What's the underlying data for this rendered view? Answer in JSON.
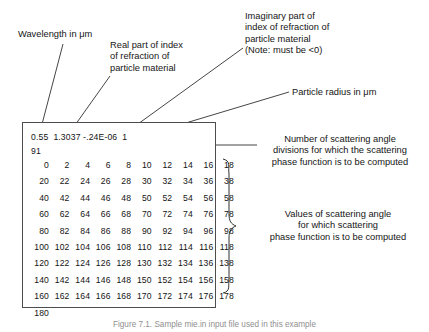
{
  "figure": {
    "caption": "Figure 7.1. Sample mie.in input file used in this example"
  },
  "annotations": {
    "wavelength": "Wavelength in μm",
    "real_index": "Real part of index\nof refraction of\nparticle material",
    "imaginary_index": "Imaginary part of\nindex of refraction of\nparticle material\n(Note: must be <0)",
    "particle_radius": "Particle radius in μm",
    "num_divisions": "Number of scattering angle\ndivisions for which the scattering\nphase function is to be computed",
    "angle_values": "Values of scattering angle\nfor which scattering\nphase function is to be computed"
  },
  "input_file": {
    "header_line": "0.55  1.3037 -.24E-06  1",
    "header_tokens": [
      "0.55",
      "1.3037",
      "-.24E-06",
      "1"
    ],
    "count_line": "91",
    "angle_rows": [
      [
        "0",
        "2",
        "4",
        "6",
        "8",
        "10",
        "12",
        "14",
        "16",
        "18"
      ],
      [
        "20",
        "22",
        "24",
        "26",
        "28",
        "30",
        "32",
        "34",
        "36",
        "38"
      ],
      [
        "40",
        "42",
        "44",
        "46",
        "48",
        "50",
        "52",
        "54",
        "56",
        "58"
      ],
      [
        "60",
        "62",
        "64",
        "66",
        "68",
        "70",
        "72",
        "74",
        "76",
        "78"
      ],
      [
        "80",
        "82",
        "84",
        "86",
        "88",
        "90",
        "92",
        "94",
        "96",
        "98"
      ],
      [
        "100",
        "102",
        "104",
        "106",
        "108",
        "110",
        "112",
        "114",
        "116",
        "118"
      ],
      [
        "120",
        "122",
        "124",
        "126",
        "128",
        "130",
        "132",
        "134",
        "136",
        "138"
      ],
      [
        "140",
        "142",
        "144",
        "146",
        "148",
        "150",
        "152",
        "154",
        "156",
        "158"
      ],
      [
        "160",
        "162",
        "164",
        "166",
        "168",
        "170",
        "172",
        "174",
        "176",
        "178"
      ],
      [
        "180"
      ]
    ]
  },
  "colors": {
    "ink": "#151515",
    "box_border": "#4d4d4d",
    "leader_line": "#303030",
    "caption": "#8f8f8f"
  }
}
